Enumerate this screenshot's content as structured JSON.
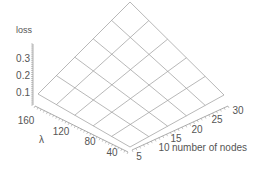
{
  "chart_data": {
    "type": "surface3d",
    "title": "",
    "zlabel": "loss",
    "ylabel": "λ",
    "xlabel": "number of nodes",
    "z_ticks": [
      "0.1",
      "0.2",
      "0.3"
    ],
    "lambda_ticks": [
      "160",
      "120",
      "80",
      "40"
    ],
    "nodes_ticks": [
      "5",
      "10",
      "15",
      "20",
      "25",
      "30"
    ],
    "x": [
      5,
      10,
      15,
      20,
      25,
      30
    ],
    "y": [
      40,
      64,
      88,
      112,
      136,
      160
    ],
    "grid_cells": [
      5,
      5
    ],
    "surface_note": "Near-planar surface; loss rises from about 0.1 at (nodes=5, λ=160) toward higher values as number of nodes increases",
    "z_range": [
      0.05,
      0.4
    ],
    "grid": false,
    "legend": "none"
  },
  "colors": {
    "surface_line": "#9a9a9a",
    "axis": "#8a8a8a",
    "text": "#555555",
    "background": "#ffffff"
  }
}
